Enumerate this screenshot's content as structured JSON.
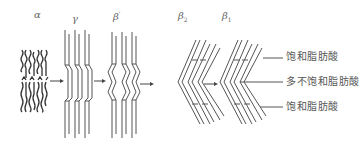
{
  "diagram": {
    "type": "crystal-polymorph-transition",
    "forms": [
      {
        "id": "alpha",
        "symbol": "α",
        "sub": "",
        "sup": ""
      },
      {
        "id": "gamma",
        "symbol": "γ",
        "sub": "",
        "sup": ""
      },
      {
        "id": "beta-prime",
        "symbol": "β",
        "sub": "",
        "sup": "'"
      },
      {
        "id": "beta2",
        "symbol": "β",
        "sub": "2",
        "sup": ""
      },
      {
        "id": "beta1",
        "symbol": "β",
        "sub": "1",
        "sup": ""
      }
    ],
    "transitions": [
      {
        "from": "alpha",
        "to": "gamma"
      },
      {
        "from": "gamma",
        "to": "beta-prime"
      },
      {
        "from": "beta-prime",
        "to": "beta2"
      },
      {
        "from": "beta2",
        "to": "beta1"
      }
    ],
    "annotations": [
      {
        "id": "top",
        "text": "饱和脂肪酸"
      },
      {
        "id": "middle",
        "text": "多不饱和脂肪酸"
      },
      {
        "id": "bottom",
        "text": "饱和脂肪酸"
      }
    ],
    "colors": {
      "line": "#555555",
      "background": "#ffffff"
    }
  }
}
